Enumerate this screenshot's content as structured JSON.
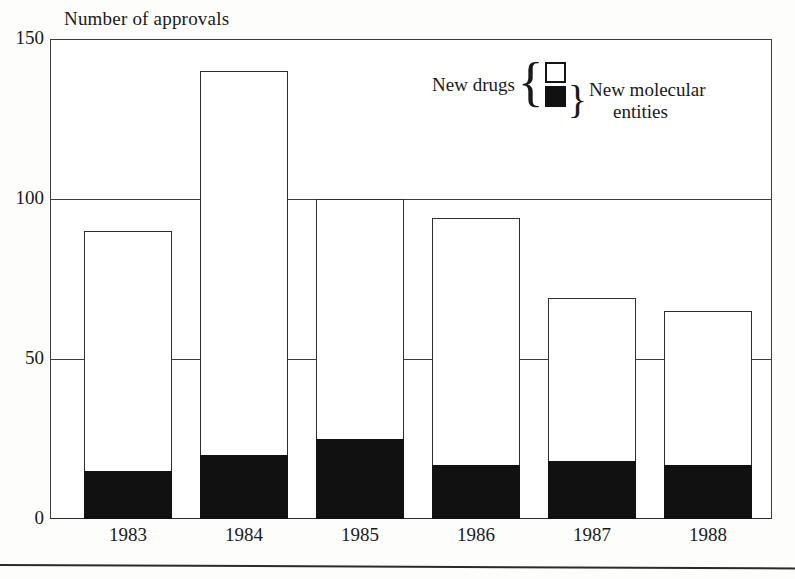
{
  "chart_data": {
    "type": "bar",
    "title": "Number of approvals",
    "xlabel": "",
    "ylabel": "",
    "ylim": [
      0,
      150
    ],
    "yticks": [
      "0",
      "50",
      "100",
      "150"
    ],
    "grid": true,
    "legend_position": "upper-right-inside",
    "stacked": true,
    "categories": [
      "1983",
      "1984",
      "1985",
      "1986",
      "1987",
      "1988"
    ],
    "series": [
      {
        "name": "New drugs",
        "swatch": "open-square",
        "values": [
          90,
          140,
          100,
          94,
          69,
          65
        ]
      },
      {
        "name": "New molecular entities",
        "swatch": "filled-square",
        "values": [
          15,
          20,
          25,
          17,
          18,
          17
        ]
      }
    ]
  },
  "legend": {
    "left_label": "New drugs",
    "open_brace": "{",
    "close_brace": "}",
    "right_label_line1": "New molecular",
    "right_label_line2": "entities",
    "swatch_open_name": "open-square-swatch",
    "swatch_filled_name": "filled-square-swatch"
  },
  "axis": {
    "y": {
      "t150": "150",
      "t100": "100",
      "t50": "50",
      "t0": "0"
    },
    "x": {
      "t0": "1983",
      "t1": "1984",
      "t2": "1985",
      "t3": "1986",
      "t4": "1987",
      "t5": "1988"
    }
  },
  "colors": {
    "new_drugs": "#ffffff",
    "new_molecular_entities": "#111111",
    "axis_line": "#2f2f2f",
    "text": "#1a1a1a",
    "background": "#ffffff"
  }
}
